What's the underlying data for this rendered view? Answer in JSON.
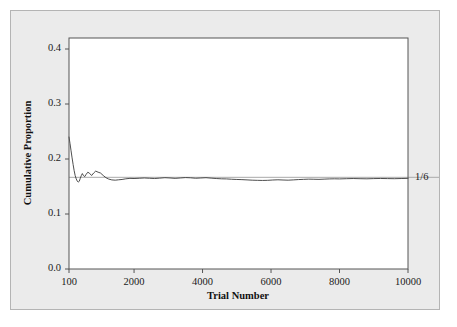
{
  "figure": {
    "background_color": "#ebebeb",
    "panel_background_color": "#ffffff",
    "border_color": "#b4b4b4",
    "axis_color": "#555555",
    "data_line_color": "#3a3a3a",
    "reference_line_color": "#aaaaaa"
  },
  "chart_data": {
    "type": "line",
    "title": "",
    "subtitle": "",
    "xlabel": "Trial Number",
    "ylabel": "Cumulative Proportion",
    "xlim": [
      100,
      10000
    ],
    "ylim": [
      0.0,
      0.42
    ],
    "xticks": [
      100,
      2000,
      4000,
      6000,
      8000,
      10000
    ],
    "xticklabels": [
      "100",
      "2000",
      "4000",
      "6000",
      "8000",
      "10000"
    ],
    "yticks": [
      0.0,
      0.1,
      0.2,
      0.3,
      0.4
    ],
    "yticklabels": [
      "0.0",
      "0.1",
      "0.2",
      "0.3",
      "0.4"
    ],
    "grid": false,
    "legend": null,
    "annotations": [
      {
        "text": "1/6",
        "x": 10000,
        "y": 0.1667,
        "position": "right-of-axis"
      }
    ],
    "reference_lines": [
      {
        "name": "one-sixth-line",
        "orientation": "horizontal",
        "y": 0.1667,
        "label": "1/6"
      }
    ],
    "series": [
      {
        "name": "Cumulative Proportion",
        "x": [
          100,
          130,
          160,
          190,
          220,
          250,
          280,
          310,
          340,
          370,
          400,
          430,
          460,
          490,
          520,
          560,
          600,
          650,
          700,
          760,
          820,
          880,
          950,
          1020,
          1100,
          1180,
          1260,
          1350,
          1450,
          1550,
          1650,
          1760,
          1880,
          2000,
          2150,
          2300,
          2450,
          2600,
          2750,
          2900,
          3050,
          3200,
          3350,
          3500,
          3650,
          3800,
          3950,
          4100,
          4250,
          4400,
          4550,
          4700,
          4850,
          5000,
          5150,
          5300,
          5450,
          5600,
          5750,
          5900,
          6050,
          6200,
          6350,
          6500,
          6650,
          6800,
          6950,
          7100,
          7250,
          7400,
          7550,
          7700,
          7850,
          8000,
          8200,
          8400,
          8600,
          8800,
          9000,
          9200,
          9400,
          9600,
          9800,
          10000
        ],
        "y": [
          0.24,
          0.228,
          0.215,
          0.202,
          0.19,
          0.179,
          0.17,
          0.164,
          0.16,
          0.158,
          0.1595,
          0.165,
          0.17,
          0.1735,
          0.17,
          0.168,
          0.172,
          0.176,
          0.174,
          0.17,
          0.1745,
          0.178,
          0.176,
          0.1745,
          0.17,
          0.166,
          0.1635,
          0.162,
          0.1615,
          0.1622,
          0.1628,
          0.164,
          0.1648,
          0.1645,
          0.165,
          0.1655,
          0.165,
          0.1645,
          0.1652,
          0.166,
          0.1655,
          0.1648,
          0.1655,
          0.1662,
          0.1658,
          0.165,
          0.1655,
          0.166,
          0.1652,
          0.1645,
          0.164,
          0.1638,
          0.1632,
          0.1628,
          0.1625,
          0.162,
          0.1615,
          0.1612,
          0.161,
          0.1612,
          0.1618,
          0.1622,
          0.1618,
          0.1615,
          0.162,
          0.1626,
          0.163,
          0.1634,
          0.1632,
          0.163,
          0.1634,
          0.1638,
          0.164,
          0.1638,
          0.1642,
          0.1645,
          0.1642,
          0.164,
          0.1644,
          0.1646,
          0.1644,
          0.1642,
          0.1645,
          0.1648
        ]
      }
    ]
  }
}
